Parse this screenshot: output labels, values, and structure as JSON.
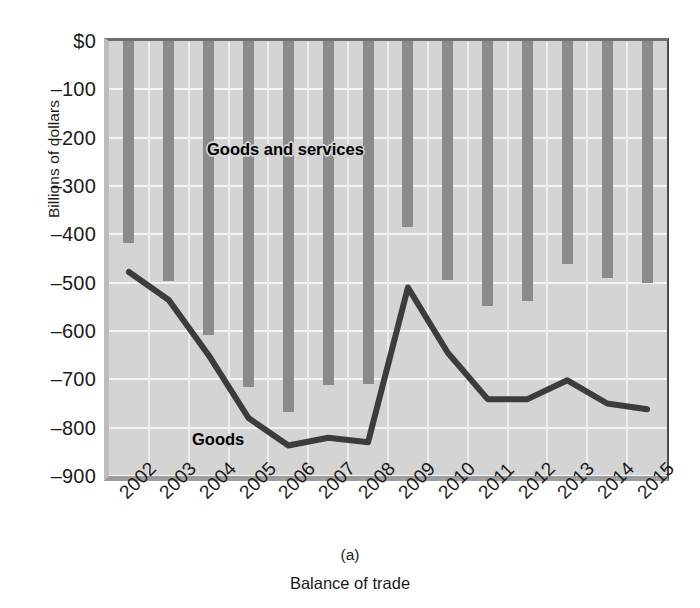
{
  "figure": {
    "panel_label": "(a)",
    "caption": "Balance of trade",
    "y_axis_title": "Billions of dollars",
    "series_label_bars": "Goods and services",
    "series_label_line": "Goods",
    "colors": {
      "bar": "#8b8b8b",
      "line": "#3c3c3c",
      "plot_background": "#d4d4d4",
      "gridline": "#f4f4f4",
      "text": "#1b1b1b"
    }
  },
  "chart_data": {
    "type": "bar",
    "title": "Balance of trade",
    "subtitle": "(a)",
    "xlabel": "",
    "ylabel": "Billions of dollars",
    "ylim": [
      -900,
      0
    ],
    "ytick_labels": [
      "$0",
      "–100",
      "–200",
      "–300",
      "–400",
      "–500",
      "–600",
      "–700",
      "–800",
      "–900"
    ],
    "ytick_values": [
      0,
      -100,
      -200,
      -300,
      -400,
      -500,
      -600,
      -700,
      -800,
      -900
    ],
    "grid": true,
    "legend": "in-plot annotations",
    "categories": [
      "2002",
      "2003",
      "2004",
      "2005",
      "2006",
      "2007",
      "2008",
      "2009",
      "2010",
      "2011",
      "2012",
      "2013",
      "2014",
      "2015"
    ],
    "series": [
      {
        "name": "Goods and services",
        "render": "bar",
        "values": [
          -418,
          -496,
          -609,
          -716,
          -767,
          -711,
          -709,
          -384,
          -495,
          -549,
          -537,
          -462,
          -490,
          -500
        ]
      },
      {
        "name": "Goods",
        "render": "line",
        "values": [
          -478,
          -536,
          -650,
          -780,
          -837,
          -821,
          -830,
          -510,
          -645,
          -741,
          -741,
          -702,
          -750,
          -762
        ]
      }
    ]
  },
  "top_fragment": "                                                    "
}
